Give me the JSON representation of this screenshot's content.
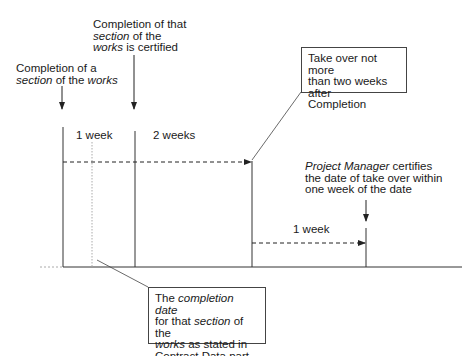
{
  "diagram": {
    "type": "timeline",
    "labels": {
      "completion_of_section": {
        "line1": "Completion of a",
        "line2_it1": "section",
        "line2_mid": " of the ",
        "line2_it2": "works"
      },
      "section_certified": {
        "line1": "Completion of that",
        "line2_it": "section",
        "line2_rest": " of the",
        "line3_it": "works",
        "line3_rest": " is certified"
      },
      "one_week_top": "1 week",
      "two_weeks": "2 weeks",
      "pm_certifies": {
        "line1_it": "Project Manager",
        "line1_rest": " certifies",
        "line2": "the date of take over within",
        "line3": "one week of the date"
      },
      "one_week_bottom": "1 week"
    },
    "boxes": {
      "take_over": {
        "line1": "Take over not more",
        "line2": "than two weeks after",
        "line3": "Completion"
      },
      "completion_date": {
        "line1_pre": "The ",
        "line1_it": "completion date",
        "line2_pre": "for that ",
        "line2_it": "section",
        "line2_rest": " of the",
        "line3_it": "works",
        "line3_rest": " as stated in",
        "line4": "Contract Data part one"
      }
    },
    "colors": {
      "line": "#222222",
      "dotted": "#aaaaaa",
      "box_border": "#444444"
    }
  }
}
